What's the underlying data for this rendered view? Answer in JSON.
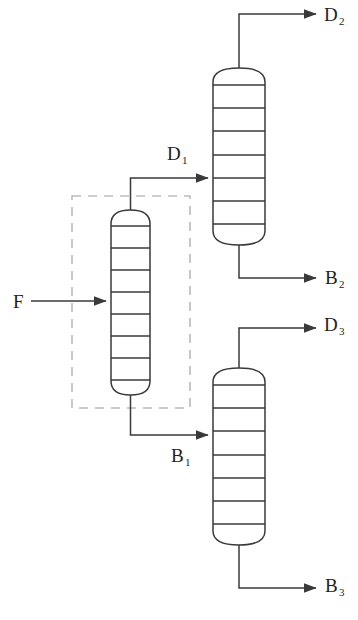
{
  "figure": {
    "type": "process-flow-diagram",
    "canvas": {
      "width": 358,
      "height": 620
    },
    "colors": {
      "background": "#ffffff",
      "line": "#3a3a3a",
      "vessel_outline": "#3a3a3a",
      "dashed_box": "#b8b8b8",
      "label_text": "#231f20"
    }
  },
  "labels": {
    "feed": {
      "text": "F",
      "sub": "",
      "x": 13,
      "y": 292
    },
    "d1": {
      "text": "D",
      "sub": "1",
      "x": 167,
      "y": 144
    },
    "d2": {
      "text": "D",
      "sub": "2",
      "x": 324,
      "y": 5
    },
    "b2": {
      "text": "B",
      "sub": "2",
      "x": 325,
      "y": 268
    },
    "d3": {
      "text": "D",
      "sub": "3",
      "x": 324,
      "y": 315
    },
    "b1": {
      "text": "B",
      "sub": "1",
      "x": 171,
      "y": 446
    },
    "b3": {
      "text": "B",
      "sub": "3",
      "x": 325,
      "y": 576
    }
  },
  "columns": [
    {
      "name": "column-1",
      "role": "first-distillation-column",
      "x": 111,
      "y": 210,
      "width": 39,
      "height": 185,
      "dome_height": 14,
      "trays": 7,
      "in_dashed_box": true
    },
    {
      "name": "column-2",
      "role": "second-distillation-column",
      "x": 213,
      "y": 68,
      "width": 52,
      "height": 177,
      "dome_height": 14,
      "trays": 7,
      "in_dashed_box": false
    },
    {
      "name": "column-3",
      "role": "third-distillation-column",
      "x": 213,
      "y": 368,
      "width": 52,
      "height": 177,
      "dome_height": 14,
      "trays": 7,
      "in_dashed_box": false
    }
  ],
  "dashed_box": {
    "x": 72,
    "y": 196,
    "width": 118,
    "height": 212
  },
  "streams": [
    {
      "name": "feed-stream",
      "label": "F",
      "from": "external",
      "to": "column-1",
      "arrow": true
    },
    {
      "name": "distillate-1-stream",
      "label": "D1",
      "from": "column-1-top",
      "to": "column-2",
      "arrow": true
    },
    {
      "name": "bottoms-1-stream",
      "label": "B1",
      "from": "column-1-bottom",
      "to": "column-3",
      "arrow": true
    },
    {
      "name": "distillate-2-stream",
      "label": "D2",
      "from": "column-2-top",
      "to": "external",
      "arrow": true
    },
    {
      "name": "bottoms-2-stream",
      "label": "B2",
      "from": "column-2-bottom",
      "to": "external",
      "arrow": true
    },
    {
      "name": "distillate-3-stream",
      "label": "D3",
      "from": "column-3-top",
      "to": "external",
      "arrow": true
    },
    {
      "name": "bottoms-3-stream",
      "label": "B3",
      "from": "column-3-bottom",
      "to": "external",
      "arrow": true
    }
  ]
}
